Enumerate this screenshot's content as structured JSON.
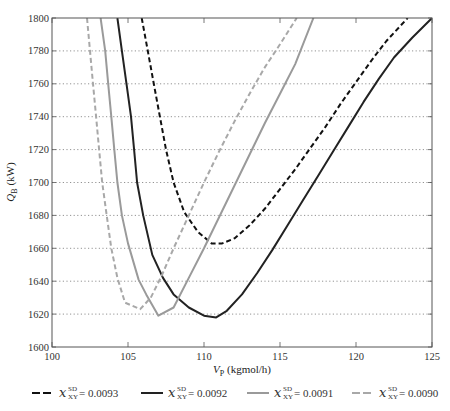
{
  "chart_data": {
    "type": "line",
    "title": "",
    "xlabel": "V",
    "xlabel_sub": "P",
    "xlabel_unit": "(kgmol/h)",
    "ylabel": "Q",
    "ylabel_sub": "B",
    "ylabel_unit": "(kW)",
    "xlim": [
      100,
      125
    ],
    "ylim": [
      1600,
      1800
    ],
    "xticks": [
      100,
      105,
      110,
      115,
      120,
      125
    ],
    "yticks": [
      1600,
      1620,
      1640,
      1660,
      1680,
      1700,
      1720,
      1740,
      1760,
      1780,
      1800
    ],
    "grid": "horizontal-dotted",
    "legend_position": "bottom",
    "legend_symbol": "x",
    "legend_superscript": "SD",
    "legend_subscript": "XY",
    "series": [
      {
        "name": "0.0093",
        "label": "= 0.0093",
        "color": "#111111",
        "style": "dashed",
        "points": [
          [
            105.9,
            1800
          ],
          [
            106.3,
            1780
          ],
          [
            106.7,
            1760
          ],
          [
            107.1,
            1740
          ],
          [
            107.5,
            1720
          ],
          [
            108.0,
            1700
          ],
          [
            108.7,
            1682
          ],
          [
            109.6,
            1670
          ],
          [
            110.5,
            1663
          ],
          [
            111.2,
            1663
          ],
          [
            112.0,
            1666
          ],
          [
            113.0,
            1674
          ],
          [
            114.0,
            1684
          ],
          [
            115.0,
            1696
          ],
          [
            116.0,
            1708
          ],
          [
            117.0,
            1721
          ],
          [
            118.0,
            1734
          ],
          [
            119.0,
            1748
          ],
          [
            120.0,
            1761
          ],
          [
            121.0,
            1774
          ],
          [
            122.0,
            1786
          ],
          [
            123.4,
            1800
          ]
        ]
      },
      {
        "name": "0.0092",
        "label": "= 0.0092",
        "color": "#222222",
        "style": "solid",
        "points": [
          [
            104.3,
            1800
          ],
          [
            104.6,
            1780
          ],
          [
            104.9,
            1760
          ],
          [
            105.2,
            1740
          ],
          [
            105.4,
            1720
          ],
          [
            105.6,
            1700
          ],
          [
            106.0,
            1680
          ],
          [
            106.6,
            1656
          ],
          [
            107.3,
            1642
          ],
          [
            108.0,
            1632
          ],
          [
            109.0,
            1624
          ],
          [
            110.0,
            1619
          ],
          [
            110.8,
            1618
          ],
          [
            111.5,
            1622
          ],
          [
            112.5,
            1632
          ],
          [
            113.5,
            1645
          ],
          [
            114.5,
            1659
          ],
          [
            115.5,
            1674
          ],
          [
            116.5,
            1689
          ],
          [
            117.5,
            1704
          ],
          [
            118.5,
            1719
          ],
          [
            119.5,
            1734
          ],
          [
            120.5,
            1749
          ],
          [
            121.5,
            1763
          ],
          [
            122.5,
            1776
          ],
          [
            123.7,
            1788
          ],
          [
            125.0,
            1800
          ]
        ]
      },
      {
        "name": "0.0091",
        "label": "= 0.0091",
        "color": "#9a9a9a",
        "style": "solid",
        "points": [
          [
            103.2,
            1800
          ],
          [
            103.5,
            1780
          ],
          [
            103.7,
            1760
          ],
          [
            103.9,
            1740
          ],
          [
            104.1,
            1720
          ],
          [
            104.3,
            1700
          ],
          [
            104.6,
            1680
          ],
          [
            105.0,
            1663
          ],
          [
            105.7,
            1641
          ],
          [
            106.2,
            1632
          ],
          [
            107.0,
            1619
          ],
          [
            108.0,
            1624
          ],
          [
            109.0,
            1642
          ],
          [
            110.0,
            1660
          ],
          [
            111.0,
            1679
          ],
          [
            112.0,
            1698
          ],
          [
            113.0,
            1717
          ],
          [
            114.0,
            1736
          ],
          [
            115.0,
            1754
          ],
          [
            116.0,
            1772
          ],
          [
            117.2,
            1800
          ]
        ]
      },
      {
        "name": "0.0090",
        "label": "= 0.0090",
        "color": "#a8a8a8",
        "style": "dashed",
        "points": [
          [
            102.3,
            1800
          ],
          [
            102.5,
            1780
          ],
          [
            102.7,
            1760
          ],
          [
            102.9,
            1740
          ],
          [
            103.1,
            1720
          ],
          [
            103.3,
            1700
          ],
          [
            103.6,
            1680
          ],
          [
            103.9,
            1660
          ],
          [
            104.3,
            1642
          ],
          [
            104.8,
            1627
          ],
          [
            105.8,
            1623
          ],
          [
            106.5,
            1630
          ],
          [
            107.2,
            1643
          ],
          [
            108.0,
            1660
          ],
          [
            109.0,
            1680
          ],
          [
            110.0,
            1700
          ],
          [
            111.0,
            1719
          ],
          [
            112.0,
            1737
          ],
          [
            113.0,
            1754
          ],
          [
            114.0,
            1770
          ],
          [
            115.0,
            1784
          ],
          [
            116.1,
            1800
          ]
        ]
      }
    ]
  }
}
